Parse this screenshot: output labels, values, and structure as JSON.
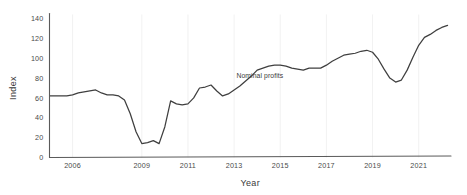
{
  "chart_data": {
    "type": "line",
    "title": "",
    "xlabel": "Year",
    "ylabel": "Index",
    "xlim": [
      2005.0,
      2022.4
    ],
    "ylim": [
      0,
      145
    ],
    "grid": true,
    "legend_position": "inline-annotation",
    "xticks": [
      2006,
      2009,
      2011,
      2013,
      2015,
      2017,
      2019,
      2021
    ],
    "xtick_labels": [
      "2006",
      "2009",
      "2011",
      "2013",
      "2015",
      "2017",
      "2019",
      "2021"
    ],
    "yticks": [
      0,
      20,
      40,
      60,
      80,
      100,
      120,
      140
    ],
    "ytick_labels": [
      "0",
      "20",
      "40",
      "60",
      "80",
      "100",
      "120",
      "140"
    ],
    "annotations": [
      {
        "text": "Nominal profits",
        "x": 2013.1,
        "y": 80
      }
    ],
    "series": [
      {
        "name": "Nominal profits",
        "color": "#3f3f3f",
        "x": [
          2005.0,
          2005.25,
          2005.5,
          2005.75,
          2006.0,
          2006.25,
          2006.5,
          2006.75,
          2007.0,
          2007.25,
          2007.5,
          2007.75,
          2008.0,
          2008.25,
          2008.5,
          2008.75,
          2009.0,
          2009.25,
          2009.5,
          2009.75,
          2010.0,
          2010.25,
          2010.5,
          2010.75,
          2011.0,
          2011.25,
          2011.5,
          2011.75,
          2012.0,
          2012.25,
          2012.5,
          2012.75,
          2013.0,
          2013.25,
          2013.5,
          2013.75,
          2014.0,
          2014.25,
          2014.5,
          2014.75,
          2015.0,
          2015.25,
          2015.5,
          2015.75,
          2016.0,
          2016.25,
          2016.5,
          2016.75,
          2017.0,
          2017.25,
          2017.5,
          2017.75,
          2018.0,
          2018.25,
          2018.5,
          2018.75,
          2019.0,
          2019.25,
          2019.5,
          2019.75,
          2020.0,
          2020.25,
          2020.5,
          2020.75,
          2021.0,
          2021.25,
          2021.5,
          2021.75,
          2022.0,
          2022.25
        ],
        "values": [
          62,
          62,
          62,
          62,
          63,
          65,
          66,
          67,
          68,
          65,
          63,
          63,
          62,
          58,
          44,
          26,
          14,
          15,
          17,
          14,
          31,
          57,
          54,
          53,
          54,
          60,
          70,
          71,
          73,
          67,
          62,
          64,
          68,
          72,
          77,
          82,
          88,
          90,
          92,
          93,
          93,
          92,
          90,
          89,
          88,
          90,
          90,
          90,
          93,
          97,
          100,
          103,
          104,
          105,
          107,
          108,
          106,
          99,
          89,
          80,
          76,
          78,
          88,
          101,
          113,
          121,
          124,
          128,
          131,
          133
        ]
      }
    ]
  }
}
